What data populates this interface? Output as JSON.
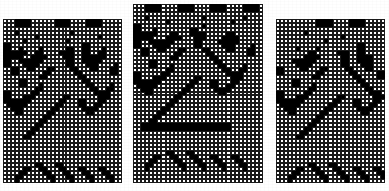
{
  "figure": {
    "title": "",
    "background_color": "#ffffff",
    "cell_on_color": "#000000",
    "cell_off_color": "#ffffff",
    "cell_outline_color": "#1a1a1a"
  },
  "chart_data": {
    "type": "heatmap",
    "title": "",
    "subtitle": "",
    "xlabel": "",
    "ylabel": "",
    "legend": [],
    "grid": true,
    "panels": [
      {
        "name": "left-panel",
        "label": "",
        "x": 3,
        "y": 19,
        "width": 119,
        "height": 164,
        "cols": 30,
        "rows": 41,
        "cell_size": 4,
        "rows_data": [
          "000111100000011110000111100000",
          "000111100000011110000111100000",
          "000000000000000000000000000000",
          "000100000000000001000000000000",
          "000000001000000000000000100000",
          "000001000000000010000000000000",
          "110000000000000000001100000000",
          "110010000100000011001100010000",
          "111111001100001111001100110000",
          "111110011110000111001111110000",
          "110011111100000011001111100000",
          "110001111000000011000111000010",
          "001100110001100001100011000110",
          "001100000011000000110000000110",
          "000000000110000000011000000000",
          "000011000000000000001100000000",
          "000011000100000000000110000100",
          "000000001100000000000011001100",
          "110000011000000000000001111000",
          "110001110000000110000000111000",
          "111111100000001100011000110000",
          "011111000000011000011001100000",
          "001110000000110000001111000000",
          "000110000001100000000110000000",
          "000000000011000000000000000000",
          "000000000110000000000000000000",
          "000000001100000000000000000000",
          "000000011000000000000000000000",
          "000000110000000000000000000000",
          "000001100000000000000000000000",
          "000000000000000000000000000000",
          "000000000000000000000000000000",
          "000000000000000000000000000000",
          "000000000000000000000000000000",
          "000000000000000000000000000000",
          "000000000000000000000000000000",
          "000000001100011000000000000000",
          "000001100110001100011000110000",
          "000011000011000110001100011000",
          "000110000001100011000110001100",
          "000100000000100001000010000100"
        ]
      },
      {
        "name": "middle-panel",
        "label": "",
        "x": 133,
        "y": 4,
        "width": 130,
        "height": 179,
        "cols": 32,
        "rows": 45,
        "cell_size": 4,
        "rows_data": [
          "00011110000111100001111000011110",
          "00011110000111100001111000011110",
          "00000000000000000000000000000000",
          "00010000000000000100000000010000",
          "00000000100000000000000010000000",
          "11000000000000000100000000000000",
          "11000100000000110000000000000000",
          "11111100011000111100000110000000",
          "11111000111100011100001111000000",
          "11001111110000011000011111000000",
          "11000111100000011000001110000100",
          "00110011000110000110000110001100",
          "00110000001100000011000000001100",
          "00000000011000000001100000000000",
          "00001100000000000000110000000000",
          "00001100010000000000011000010000",
          "00000000110000000000001100110000",
          "11000001100000000000000111100000",
          "11000111000000011000000011100000",
          "11111110000000110001100011000000",
          "01111100000001100001100110000000",
          "00111000000011000000111100000000",
          "00011000000110000000011000000000",
          "00000000001100000000000000000000",
          "00000000011000000000000000000000",
          "00000000110000000000000000000000",
          "00000001100000000000000000000000",
          "00000011000000000000000000000000",
          "00000110000000000000000000000000",
          "00001100000000000000000000000000",
          "00111111111111111111111100000000",
          "00111111111111111111111100000000",
          "00000000000000000000000000000000",
          "00000000000000000000000000000000",
          "00000000000000000000000000000000",
          "00000000000000000000000000000000",
          "00000000000000000000000000000000",
          "00000000110001100000000000000000",
          "00000110011000110001100011000000",
          "00001100001100011000110001100000",
          "00011000000110001100011000110000",
          "00010000000010000100001000010000",
          "00000000000000000000000000000000",
          "00000000000000000000000000000000",
          "00000000000000000000000000000000"
        ]
      },
      {
        "name": "right-panel",
        "label": "",
        "x": 276,
        "y": 19,
        "width": 109,
        "height": 164,
        "cols": 27,
        "rows": 41,
        "cell_size": 4,
        "rows_data": [
          "000000000011110000111100000",
          "000000000011110000111100000",
          "000000000000000000000000000",
          "000000010000000000000000000",
          "000000000000000010000000000",
          "000000000000100000000000000",
          "000000000000000000001100000",
          "000001000010000000001100000",
          "000000001100000111001100000",
          "000000011110000011001111000",
          "000011111100000011001111000",
          "000001111000000011000111000",
          "110000110001100001100011000",
          "110000000011000000110000011",
          "000000000110000000011000011",
          "000011000000000000001100000",
          "000011000100000000000110000",
          "000000001100000000000011000",
          "110000011000000000000001110",
          "110001110000000110000000111",
          "111111100000001100011000110",
          "011111000000011000011001100",
          "001110000000110000001111000",
          "000110000001100000000110000",
          "000000000011000000000000000",
          "000000000110000000000000000",
          "000000001100000000000000000",
          "000000011000000000000000000",
          "000000110000000000000000000",
          "000001100000000000000000000",
          "000000000000000000000000000",
          "000000000000000000000000000",
          "000000000000000000000000000",
          "000000000000000000000000000",
          "000000000000000000000000000",
          "000000000000000000000000000",
          "000000001100011000000000000",
          "000001100110001100011000110",
          "000011000011000110001100011",
          "000110000001100011000110001",
          "000100000000100001000010000"
        ]
      }
    ]
  }
}
